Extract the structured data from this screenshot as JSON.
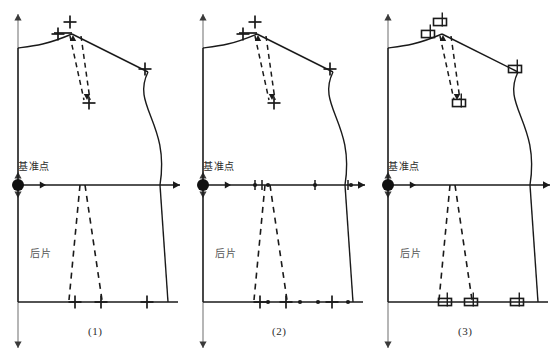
{
  "figure": {
    "type": "technical-drawing",
    "background_color": "#ffffff",
    "line_color": "#1a1a1a",
    "text_color": "#2b2b2b"
  },
  "panels": [
    {
      "id": "panel-1",
      "caption": "(1)",
      "caption_x": 88,
      "caption_y": 330,
      "origin_x": 0,
      "marker_style": "cross",
      "labels": {
        "reference_point": "基准点",
        "reference_point_x": 18,
        "reference_point_y": 166,
        "piece_name": "后片",
        "piece_name_x": 30,
        "piece_name_y": 250
      },
      "reference_dot": {
        "cx": 18,
        "cy": 185,
        "r": 6
      },
      "markers": [
        {
          "x": 70,
          "y": 22,
          "size": 13
        },
        {
          "x": 58,
          "y": 34,
          "size": 13
        },
        {
          "x": 89,
          "y": 103,
          "size": 13
        },
        {
          "x": 145,
          "y": 69,
          "size": 13
        },
        {
          "x": 75,
          "y": 302,
          "size": 13
        },
        {
          "x": 101,
          "y": 302,
          "size": 13
        },
        {
          "x": 147,
          "y": 302,
          "size": 13
        }
      ],
      "dots": []
    },
    {
      "id": "panel-2",
      "caption": "(2)",
      "caption_x": 272,
      "caption_y": 330,
      "origin_x": 185,
      "marker_style": "cross-with-dots",
      "labels": {
        "reference_point": "基准点",
        "reference_point_x": 203,
        "reference_point_y": 166,
        "piece_name": "后片",
        "piece_name_x": 215,
        "piece_name_y": 250
      },
      "reference_dot": {
        "cx": 203,
        "cy": 185,
        "r": 6
      },
      "markers": [
        {
          "x": 255,
          "y": 22,
          "size": 13
        },
        {
          "x": 243,
          "y": 34,
          "size": 13
        },
        {
          "x": 274,
          "y": 103,
          "size": 13
        },
        {
          "x": 330,
          "y": 69,
          "size": 13
        },
        {
          "x": 260,
          "y": 302,
          "size": 13
        },
        {
          "x": 286,
          "y": 302,
          "size": 13
        },
        {
          "x": 332,
          "y": 302,
          "size": 13
        }
      ],
      "dots": [
        {
          "x": 255,
          "y": 185
        },
        {
          "x": 268,
          "y": 185
        },
        {
          "x": 315,
          "y": 185
        },
        {
          "x": 351,
          "y": 185
        },
        {
          "x": 268,
          "y": 302
        },
        {
          "x": 300,
          "y": 302
        },
        {
          "x": 318,
          "y": 302
        },
        {
          "x": 348,
          "y": 302
        }
      ]
    },
    {
      "id": "panel-3",
      "caption": "(3)",
      "caption_x": 458,
      "caption_y": 330,
      "origin_x": 370,
      "marker_style": "rectangle",
      "labels": {
        "reference_point": "基准点",
        "reference_point_x": 388,
        "reference_point_y": 166,
        "piece_name": "后片",
        "piece_name_x": 400,
        "piece_name_y": 250
      },
      "reference_dot": {
        "cx": 388,
        "cy": 185,
        "r": 6
      },
      "markers": [
        {
          "x": 440,
          "y": 22,
          "size": 13
        },
        {
          "x": 428,
          "y": 34,
          "size": 13
        },
        {
          "x": 459,
          "y": 103,
          "size": 13
        },
        {
          "x": 515,
          "y": 69,
          "size": 13
        },
        {
          "x": 445,
          "y": 302,
          "size": 13
        },
        {
          "x": 471,
          "y": 302,
          "size": 13
        },
        {
          "x": 517,
          "y": 302,
          "size": 13
        }
      ],
      "dots": []
    }
  ],
  "geometry": {
    "center_back_x": 18,
    "neck_top_y": 48,
    "waist_y": 185,
    "hem_y": 302,
    "shoulder_tip_x": 148,
    "shoulder_tip_y": 72,
    "neck_point_x": 72,
    "neck_point_y": 32,
    "side_waist_x": 160,
    "hem_right_x": 168,
    "shoulder_dart_apex_x": 88,
    "shoulder_dart_apex_y": 100,
    "waist_dart_center_x": 82,
    "waist_dart_top_y": 185,
    "waist_dart_bottom_y": 300
  }
}
